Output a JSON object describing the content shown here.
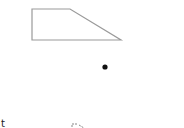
{
  "canvas": {
    "background": "#ffffff"
  },
  "shapes": {
    "trapezoid": {
      "stroke": "#9a9a9a",
      "fill": "none",
      "label": "trapezoid"
    },
    "dot": {
      "fill": "#111111",
      "label": "point"
    },
    "dashed_shape": {
      "stroke": "#888888",
      "label": "partial dashed shape"
    }
  },
  "partial_text": "t"
}
